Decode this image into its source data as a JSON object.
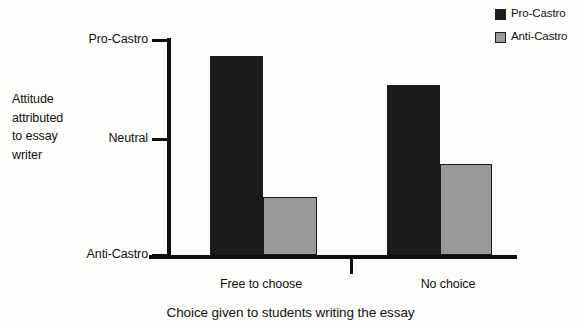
{
  "chart_data": {
    "type": "bar",
    "title": "",
    "xlabel": "Choice given to students writing the essay",
    "ylabel": "Attitude attributed to essay writer",
    "ylabel_lines": [
      "Attitude",
      "attributed",
      "to essay",
      "writer"
    ],
    "categories": [
      "Free to choose",
      "No choice"
    ],
    "ytick_labels": [
      "Pro-Castro",
      "Neutral",
      "Anti-Castro"
    ],
    "ytick_values": [
      100,
      54,
      0
    ],
    "ylim": [
      0,
      100
    ],
    "grid": false,
    "legend_position": "top-right",
    "series": [
      {
        "name": "Pro-Castro",
        "color": "#1c1c1c",
        "values": [
          92.5,
          79.1
        ]
      },
      {
        "name": "Anti-Castro",
        "color": "#9a9a9a",
        "values": [
          27.0,
          42.3
        ]
      }
    ]
  },
  "legend": {
    "items": [
      {
        "label": "Pro-Castro",
        "color": "#1c1c1c"
      },
      {
        "label": "Anti-Castro",
        "color": "#9a9a9a"
      }
    ]
  },
  "colors": {
    "pro_castro": "#1c1c1c",
    "anti_castro": "#9a9a9a",
    "axis": "#0d0d0d",
    "text": "#111111",
    "background": "#fdfdfc"
  }
}
